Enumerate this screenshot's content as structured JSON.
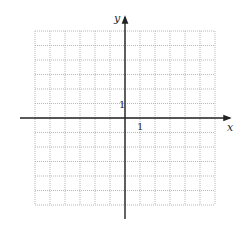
{
  "diagram": {
    "type": "coordinate-plane",
    "grid": {
      "columns": 12,
      "rows": 12,
      "x_range": [
        -6,
        6
      ],
      "y_range": [
        -6,
        6
      ],
      "left_px": 35,
      "top_px": 31,
      "cell_w_px": 15,
      "cell_h_px": 14.5,
      "line_color": "#b8b8b8",
      "line_style": "dotted"
    },
    "axes": {
      "color": "#222222",
      "x_label": "x",
      "y_label": "y",
      "x_tick_label": "1",
      "y_tick_label": "1"
    }
  }
}
